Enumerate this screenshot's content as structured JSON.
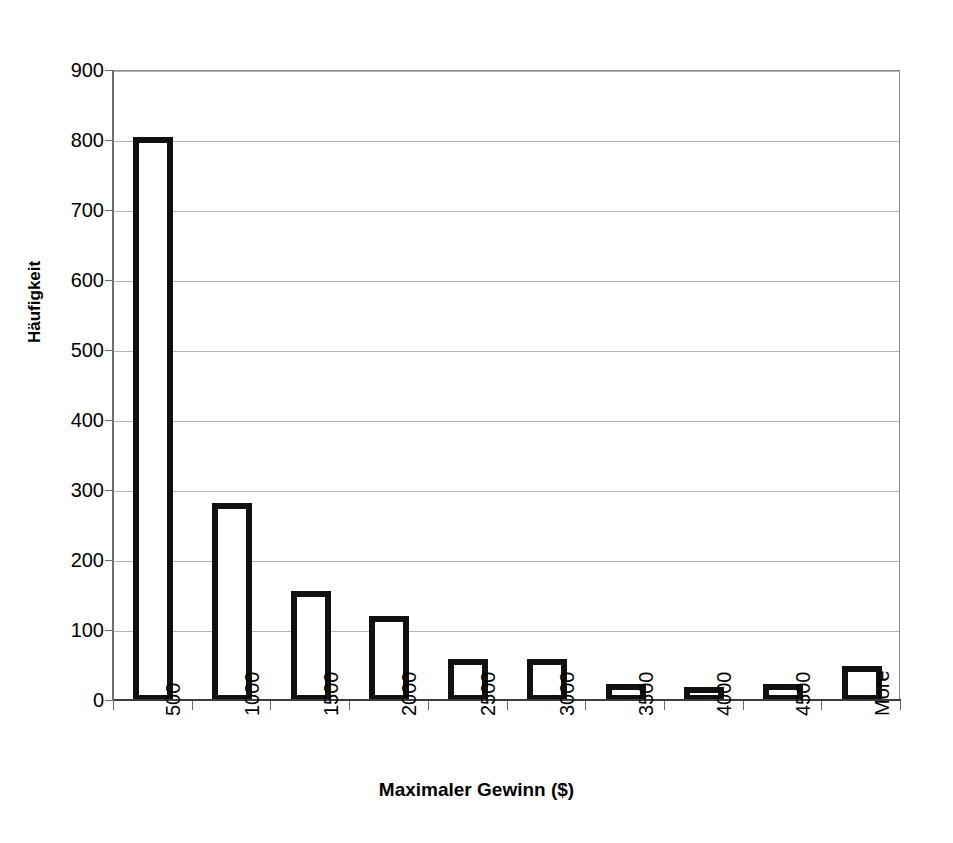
{
  "chart_data": {
    "type": "bar",
    "title": "",
    "xlabel": "Maximaler Gewinn ($)",
    "ylabel": "Häufigkeit",
    "categories": [
      "500",
      "1000",
      "1500",
      "2000",
      "2500",
      "3000",
      "3500",
      "4000",
      "4500",
      "More"
    ],
    "values": [
      806,
      283,
      157,
      121,
      60,
      60,
      25,
      20,
      24,
      50
    ],
    "ylim": [
      0,
      900
    ],
    "ytick_labels": [
      "0",
      "100",
      "200",
      "300",
      "400",
      "500",
      "600",
      "700",
      "800",
      "900"
    ],
    "ytick_values": [
      0,
      100,
      200,
      300,
      400,
      500,
      600,
      700,
      800,
      900
    ],
    "grid": "horizontal",
    "legend": "none",
    "bar_style": {
      "fill": "#ffffff",
      "edge": "#111111",
      "edge_width_px": 6
    },
    "colors": {
      "gridline": "#b4b4b4",
      "axis": "#6b6b6b",
      "text": "#000000",
      "background": "#ffffff"
    },
    "xtick_rotation_deg": 90
  }
}
